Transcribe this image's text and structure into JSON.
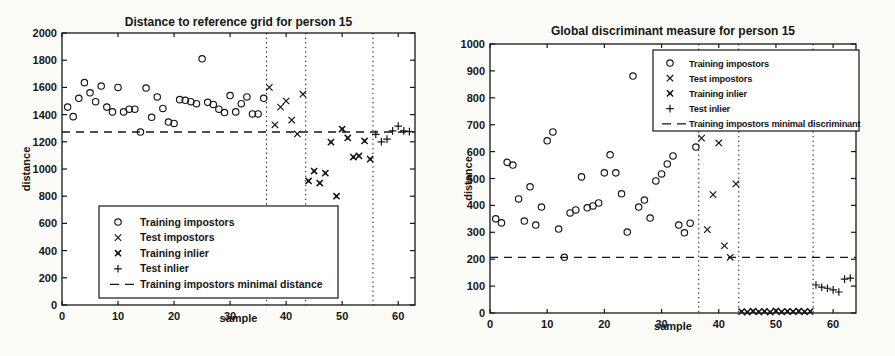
{
  "figure": {
    "background": "#fbfbf8",
    "ink_color": "#161616"
  },
  "chart_data": [
    {
      "type": "scatter",
      "title": "Distance to reference grid for person 15",
      "xlabel": "sample",
      "ylabel": "distance",
      "xlim": [
        0,
        63
      ],
      "ylim": [
        0,
        2000
      ],
      "xticks": [
        0,
        10,
        20,
        30,
        40,
        50,
        60
      ],
      "yticks": [
        0,
        200,
        400,
        600,
        800,
        1000,
        1200,
        1400,
        1600,
        1800,
        2000
      ],
      "grid": false,
      "legend_position": "bottom-left",
      "legend": [
        "Training impostors",
        "Test impostors",
        "Training inlier",
        "Test inlier",
        "Training impostors minimal distance"
      ],
      "legend_markers": [
        "circle",
        "x",
        "star",
        "plus",
        "dash"
      ],
      "vlines": {
        "style": "dotted",
        "x": [
          36.5,
          43.5,
          55.5
        ]
      },
      "hline": {
        "style": "dashed",
        "y": 1272,
        "label": "Training impostors minimal distance"
      },
      "series": [
        {
          "name": "Training impostors",
          "marker": "circle",
          "points": [
            [
              1,
              1455
            ],
            [
              2,
              1385
            ],
            [
              3,
              1520
            ],
            [
              4,
              1635
            ],
            [
              5,
              1560
            ],
            [
              6,
              1495
            ],
            [
              7,
              1610
            ],
            [
              8,
              1455
            ],
            [
              9,
              1420
            ],
            [
              10,
              1600
            ],
            [
              11,
              1420
            ],
            [
              12,
              1440
            ],
            [
              13,
              1440
            ],
            [
              14,
              1272
            ],
            [
              15,
              1595
            ],
            [
              16,
              1380
            ],
            [
              17,
              1530
            ],
            [
              18,
              1445
            ],
            [
              19,
              1345
            ],
            [
              20,
              1335
            ],
            [
              21,
              1510
            ],
            [
              22,
              1505
            ],
            [
              23,
              1495
            ],
            [
              24,
              1480
            ],
            [
              25,
              1810
            ],
            [
              26,
              1490
            ],
            [
              27,
              1475
            ],
            [
              28,
              1440
            ],
            [
              29,
              1415
            ],
            [
              30,
              1540
            ],
            [
              31,
              1420
            ],
            [
              32,
              1480
            ],
            [
              33,
              1530
            ],
            [
              34,
              1405
            ],
            [
              35,
              1405
            ],
            [
              36,
              1520
            ]
          ]
        },
        {
          "name": "Test impostors",
          "marker": "x",
          "points": [
            [
              37,
              1600
            ],
            [
              38,
              1325
            ],
            [
              39,
              1455
            ],
            [
              40,
              1500
            ],
            [
              41,
              1360
            ],
            [
              42,
              1258
            ],
            [
              43,
              1550
            ]
          ]
        },
        {
          "name": "Training inlier",
          "marker": "star",
          "points": [
            [
              44,
              912
            ],
            [
              45,
              985
            ],
            [
              46,
              897
            ],
            [
              47,
              970
            ],
            [
              48,
              1198
            ],
            [
              49,
              800
            ],
            [
              50,
              1294
            ],
            [
              51,
              1228
            ],
            [
              52,
              1088
            ],
            [
              53,
              1096
            ],
            [
              54,
              1206
            ],
            [
              55,
              1073
            ]
          ]
        },
        {
          "name": "Test inlier",
          "marker": "plus",
          "points": [
            [
              56,
              1255
            ],
            [
              57,
              1200
            ],
            [
              58,
              1220
            ],
            [
              59,
              1280
            ],
            [
              60,
              1315
            ],
            [
              61,
              1280
            ],
            [
              62,
              1275
            ]
          ]
        }
      ]
    },
    {
      "type": "scatter",
      "title": "Global discriminant measure for person 15",
      "xlabel": "sample",
      "ylabel": "distance",
      "xlim": [
        0,
        64
      ],
      "ylim": [
        0,
        1000
      ],
      "xticks": [
        0,
        10,
        20,
        30,
        40,
        50,
        60
      ],
      "yticks": [
        0,
        100,
        200,
        300,
        400,
        500,
        600,
        700,
        800,
        900,
        1000
      ],
      "grid": false,
      "legend_position": "top-right",
      "legend": [
        "Training impostors",
        "Test impostors",
        "Training inlier",
        "Test inlier",
        "Training impostors minimal discriminant"
      ],
      "legend_markers": [
        "circle",
        "x",
        "star",
        "plus",
        "dash"
      ],
      "vlines": {
        "style": "dotted",
        "x": [
          36.5,
          43.5,
          56.5
        ]
      },
      "hline": {
        "style": "dashed",
        "y": 207,
        "label": "Training impostors minimal discriminant"
      },
      "series": [
        {
          "name": "Training impostors",
          "marker": "circle",
          "points": [
            [
              1,
              350
            ],
            [
              2,
              335
            ],
            [
              3,
              560
            ],
            [
              4,
              550
            ],
            [
              5,
              424
            ],
            [
              6,
              342
            ],
            [
              7,
              469
            ],
            [
              8,
              327
            ],
            [
              9,
              394
            ],
            [
              10,
              640
            ],
            [
              11,
              673
            ],
            [
              12,
              312
            ],
            [
              13,
              207
            ],
            [
              14,
              372
            ],
            [
              15,
              383
            ],
            [
              16,
              506
            ],
            [
              17,
              391
            ],
            [
              18,
              398
            ],
            [
              19,
              409
            ],
            [
              20,
              521
            ],
            [
              21,
              588
            ],
            [
              22,
              521
            ],
            [
              23,
              443
            ],
            [
              24,
              301
            ],
            [
              25,
              881
            ],
            [
              26,
              394
            ],
            [
              27,
              420
            ],
            [
              28,
              353
            ],
            [
              29,
              491
            ],
            [
              30,
              517
            ],
            [
              31,
              554
            ],
            [
              32,
              584
            ],
            [
              33,
              327
            ],
            [
              34,
              298
            ],
            [
              35,
              334
            ],
            [
              36,
              617
            ]
          ]
        },
        {
          "name": "Test impostors",
          "marker": "x",
          "points": [
            [
              37,
              650
            ],
            [
              38,
              310
            ],
            [
              39,
              440
            ],
            [
              40,
              632
            ],
            [
              41,
              250
            ],
            [
              42,
              207
            ],
            [
              43,
              480
            ]
          ]
        },
        {
          "name": "Training inlier",
          "marker": "star",
          "points": [
            [
              44,
              5
            ],
            [
              45,
              3
            ],
            [
              46,
              7
            ],
            [
              47,
              4
            ],
            [
              48,
              6
            ],
            [
              49,
              3
            ],
            [
              50,
              8
            ],
            [
              51,
              4
            ],
            [
              52,
              6
            ],
            [
              53,
              5
            ],
            [
              54,
              7
            ],
            [
              55,
              4
            ],
            [
              56,
              6
            ]
          ]
        },
        {
          "name": "Test inlier",
          "marker": "plus",
          "points": [
            [
              57,
              104
            ],
            [
              58,
              96
            ],
            [
              59,
              92
            ],
            [
              60,
              86
            ],
            [
              61,
              78
            ],
            [
              62,
              126
            ],
            [
              63,
              130
            ]
          ]
        }
      ]
    }
  ]
}
